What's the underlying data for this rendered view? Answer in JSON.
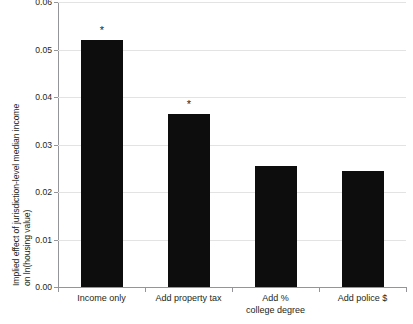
{
  "chart_data": {
    "type": "bar",
    "title": "",
    "xlabel": "",
    "ylabel": "Implied effect of jurisdiction-level median income on ln(housing value)",
    "ylabel_lines": [
      "Implied effect of jurisdiction-level median income",
      "on ln(housing value)"
    ],
    "categories": [
      "Income only",
      "Add property tax",
      "Add % college degree",
      "Add police $"
    ],
    "category_lines": [
      [
        "Income only"
      ],
      [
        "Add property tax"
      ],
      [
        "Add %",
        "college degree"
      ],
      [
        "Add police $"
      ]
    ],
    "values": [
      0.052,
      0.0365,
      0.0255,
      0.0245
    ],
    "annotations": [
      "*",
      "*",
      "",
      ""
    ],
    "ylim": [
      0.0,
      0.06
    ],
    "ytick_values": [
      0.0,
      0.01,
      0.02,
      0.03,
      0.04,
      0.05,
      0.06
    ],
    "ytick_labels": [
      "0.00",
      "0.01",
      "0.02",
      "0.03",
      "0.04",
      "0.05",
      "0.06"
    ],
    "grid": true,
    "legend": "none",
    "colors": {
      "bar": "#0d0d0d",
      "grid": "#e3e3e3",
      "axis": "#939598",
      "text": "#231f20",
      "background": "#ffffff"
    }
  }
}
